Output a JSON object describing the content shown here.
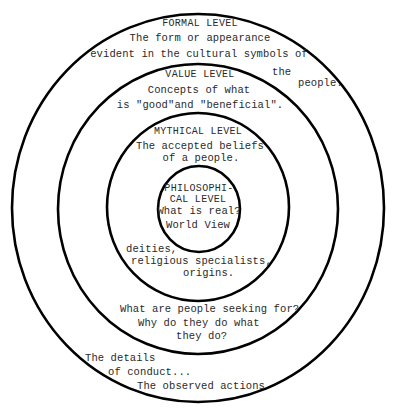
{
  "diagram": {
    "type": "concentric-circles",
    "rings": [
      {
        "id": "formal",
        "title": "FORMAL LEVEL",
        "description_lines": [
          "The form or appearance",
          "evident in the cultural symbols of",
          "the",
          "people."
        ],
        "bottom_lines": [
          "The details",
          "of conduct...",
          "The observed actions"
        ]
      },
      {
        "id": "value",
        "title": "VALUE LEVEL",
        "description_lines": [
          "Concepts of what",
          "is \"good\"and \"beneficial\"."
        ],
        "bottom_lines": [
          "What are people seeking for?",
          "Why do they do what",
          "they do?"
        ]
      },
      {
        "id": "mythical",
        "title": "MYTHICAL LEVEL",
        "description_lines": [
          "The accepted beliefs",
          "of a people."
        ],
        "bottom_lines": [
          "deities,",
          "religious specialists,",
          "origins."
        ]
      },
      {
        "id": "philosophical",
        "title_lines": [
          "PHILOSOPHI-",
          "CAL LEVEL"
        ],
        "description_lines": [
          "What is real?",
          "World View"
        ]
      }
    ],
    "stroke_color": "#000000",
    "text_color": "#2a2a2a",
    "background": "#ffffff"
  }
}
